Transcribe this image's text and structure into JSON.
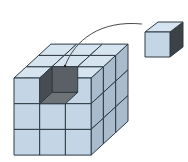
{
  "diagram": {
    "title": "",
    "big_cube": {
      "grid": 3,
      "origin": [
        14,
        78
      ],
      "cell": 25.7,
      "depth_dx": 12.3,
      "depth_dy": -11.3,
      "removed_cell": {
        "x": 1,
        "y": 2,
        "z": 0
      }
    },
    "small_cube": {
      "front": [
        145,
        32
      ],
      "size": 25,
      "depth_dx": 13,
      "depth_dy": -10
    },
    "arc": {
      "from": [
        65,
        66
      ],
      "to": [
        142,
        24
      ]
    },
    "colors": {
      "front_face": "#c4d6e6",
      "top_face": "#d6e4f0",
      "side_face": "#a9bccd",
      "edge": "#2e3a44",
      "hole_left_wall": "#474c52",
      "hole_back_wall": "#5b6066",
      "hole_floor": "#6e7378",
      "small_side": "#3d4247",
      "arc": "#4a4a4a"
    }
  }
}
